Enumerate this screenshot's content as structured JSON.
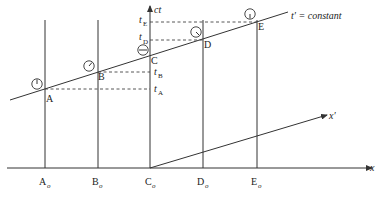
{
  "diagram": {
    "axes": {
      "x_label": "x",
      "ct_label": "ct",
      "x_prime_label": "x′"
    },
    "line_label": "t′ = constant",
    "events": [
      {
        "name": "A",
        "base_label": "A",
        "base_sub": "o",
        "time_label": "t",
        "time_sub": "A"
      },
      {
        "name": "B",
        "base_label": "B",
        "base_sub": "o",
        "time_label": "t",
        "time_sub": "B"
      },
      {
        "name": "C",
        "base_label": "C",
        "base_sub": "o"
      },
      {
        "name": "D",
        "base_label": "D",
        "base_sub": "o",
        "time_label": "t",
        "time_sub": "D"
      },
      {
        "name": "E",
        "base_label": "E",
        "base_sub": "o",
        "time_label": "t",
        "time_sub": "E"
      }
    ],
    "colors": {
      "stroke": "#333333",
      "background": "#ffffff"
    }
  }
}
